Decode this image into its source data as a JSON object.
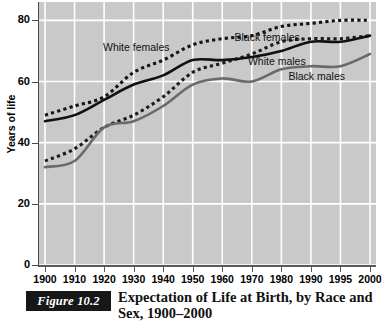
{
  "figure": {
    "tag": "Figure 10.2",
    "caption_line1": "Expectation of Life at Birth, by Race and",
    "caption_line2": "Sex, 1900–2000"
  },
  "chart_data": {
    "type": "line",
    "title": "Expectation of Life at Birth, by Race and Sex, 1900–2000",
    "xlabel": "",
    "ylabel": "Years of life",
    "categories": [
      "1900",
      "1910",
      "1920",
      "1930",
      "1940",
      "1950",
      "1960",
      "1970",
      "1980",
      "1990",
      "1995",
      "2000"
    ],
    "xtick_labels": [
      "1900",
      "1910",
      "1920",
      "1930",
      "1940",
      "1950",
      "1960",
      "1970",
      "1980",
      "1990",
      "1995",
      "2000"
    ],
    "ytick_labels": [
      "0",
      "20",
      "40",
      "60",
      "80"
    ],
    "yticks": [
      0,
      20,
      40,
      60,
      80
    ],
    "ylim": [
      0,
      86
    ],
    "grid": true,
    "grid_color": "#ffffff",
    "plot_background": "#c9c9c9",
    "legend": "inline-labels",
    "series": [
      {
        "name": "White females",
        "style": "dotted",
        "color": "#141414",
        "label_x_pct": 19,
        "label_y_pct": 15,
        "values": [
          49,
          52,
          55,
          63,
          67,
          72,
          74,
          75,
          78,
          79,
          80,
          80
        ]
      },
      {
        "name": "Black females",
        "style": "dotted",
        "color": "#1c1c1c",
        "label_x_pct": 58,
        "label_y_pct": 11,
        "values": [
          34,
          38,
          45,
          49,
          55,
          63,
          66,
          69,
          73,
          74,
          74,
          75
        ]
      },
      {
        "name": "White males",
        "style": "solid",
        "color": "#101010",
        "label_x_pct": 62,
        "label_y_pct": 20,
        "values": [
          47,
          49,
          54,
          59,
          62,
          67,
          67,
          68,
          70,
          73,
          73,
          75
        ]
      },
      {
        "name": "Black males",
        "style": "solid",
        "color": "#6a6a6a",
        "label_x_pct": 74,
        "label_y_pct": 26,
        "values": [
          32,
          34,
          45,
          47,
          52,
          59,
          61,
          60,
          64,
          65,
          65,
          69
        ]
      }
    ],
    "annotations": [
      {
        "text": "White females"
      },
      {
        "text": "Black females"
      },
      {
        "text": "White males"
      },
      {
        "text": "Black males"
      }
    ]
  }
}
